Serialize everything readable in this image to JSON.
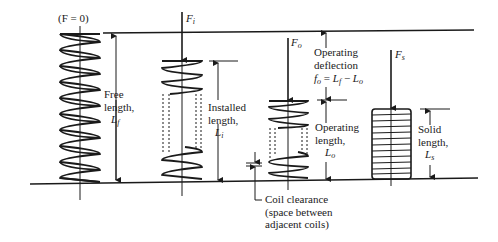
{
  "diagram": {
    "type": "compression spring lengths and forces",
    "springs": [
      {
        "id": "free",
        "force_label": "(F = 0)",
        "dim_label_lines": [
          "Free",
          "length,",
          "L"
        ],
        "dim_subscript": "f"
      },
      {
        "id": "installed",
        "force_label": "F",
        "force_subscript": "i",
        "dim_label_lines": [
          "Installed",
          "length,",
          "L"
        ],
        "dim_subscript": "i"
      },
      {
        "id": "operating",
        "force_label": "F",
        "force_subscript": "o",
        "dim_label_lines": [
          "Operating",
          "length,",
          "L"
        ],
        "dim_subscript": "o"
      },
      {
        "id": "solid",
        "force_label": "F",
        "force_subscript": "s",
        "dim_label_lines": [
          "Solid",
          "length,",
          "L"
        ],
        "dim_subscript": "s"
      }
    ],
    "deflection": {
      "lines": [
        "Operating",
        "deflection"
      ],
      "formula": "fo = Lf − Lo",
      "f": "f",
      "f_sub": "o",
      "eq": " = ",
      "L1": "L",
      "L1_sub": "f",
      "minus": " − ",
      "L2": "L",
      "L2_sub": "o"
    },
    "clearance": {
      "lines": [
        "Coil clearance",
        "(space between",
        "adjacent coils)"
      ]
    }
  }
}
